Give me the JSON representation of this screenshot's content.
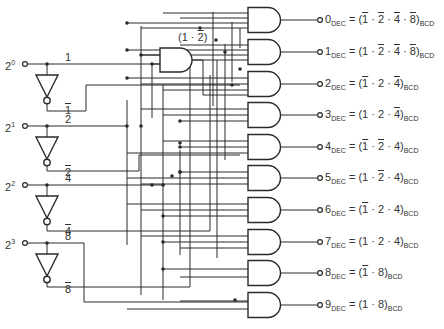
{
  "diagram": {
    "inputs": [
      {
        "base": "2",
        "exp": "0",
        "line": "1",
        "inv": "1"
      },
      {
        "base": "2",
        "exp": "1",
        "line": "2",
        "inv": "2"
      },
      {
        "base": "2",
        "exp": "2",
        "line": "4",
        "inv": "4"
      },
      {
        "base": "2",
        "exp": "3",
        "line": "8",
        "inv": "8"
      }
    ],
    "intermediate_gate": {
      "label": "(1 · 2)",
      "expr_parts": [
        "(",
        "1",
        " · ",
        "2̄",
        ")"
      ]
    },
    "outputs": [
      {
        "digit": "0",
        "sub": "DEC",
        "terms": [
          {
            "t": "1",
            "bar": true
          },
          {
            "t": "2",
            "bar": true
          },
          {
            "t": "4",
            "bar": true
          },
          {
            "t": "8",
            "bar": true
          }
        ],
        "suffix": "BCD"
      },
      {
        "digit": "1",
        "sub": "DEC",
        "terms": [
          {
            "t": "1",
            "bar": false
          },
          {
            "t": "2",
            "bar": true
          },
          {
            "t": "4",
            "bar": true
          },
          {
            "t": "8",
            "bar": true
          }
        ],
        "suffix": "BCD"
      },
      {
        "digit": "2",
        "sub": "DEC",
        "terms": [
          {
            "t": "1",
            "bar": true
          },
          {
            "t": "2",
            "bar": false
          },
          {
            "t": "4",
            "bar": true
          }
        ],
        "suffix": "BCD"
      },
      {
        "digit": "3",
        "sub": "DEC",
        "terms": [
          {
            "t": "1",
            "bar": false
          },
          {
            "t": "2",
            "bar": false
          },
          {
            "t": "4",
            "bar": true
          }
        ],
        "suffix": "BCD"
      },
      {
        "digit": "4",
        "sub": "DEC",
        "terms": [
          {
            "t": "1",
            "bar": true
          },
          {
            "t": "2",
            "bar": true
          },
          {
            "t": "4",
            "bar": false
          }
        ],
        "suffix": "BCD"
      },
      {
        "digit": "5",
        "sub": "DEC",
        "terms": [
          {
            "t": "1",
            "bar": false
          },
          {
            "t": "2",
            "bar": true
          },
          {
            "t": "4",
            "bar": false
          }
        ],
        "suffix": "BCD"
      },
      {
        "digit": "6",
        "sub": "DEC",
        "terms": [
          {
            "t": "1",
            "bar": true
          },
          {
            "t": "2",
            "bar": false
          },
          {
            "t": "4",
            "bar": false
          }
        ],
        "suffix": "BCD"
      },
      {
        "digit": "7",
        "sub": "DEC",
        "terms": [
          {
            "t": "1",
            "bar": false
          },
          {
            "t": "2",
            "bar": false
          },
          {
            "t": "4",
            "bar": false
          }
        ],
        "suffix": "BCD"
      },
      {
        "digit": "8",
        "sub": "DEC",
        "terms": [
          {
            "t": "1",
            "bar": true
          },
          {
            "t": "8",
            "bar": false
          }
        ],
        "suffix": "BCD"
      },
      {
        "digit": "9",
        "sub": "DEC",
        "terms": [
          {
            "t": "1",
            "bar": false
          },
          {
            "t": "8",
            "bar": false
          }
        ],
        "suffix": "BCD"
      }
    ],
    "colors": {
      "ink": "#2a2a2a",
      "background": "#ffffff"
    }
  }
}
